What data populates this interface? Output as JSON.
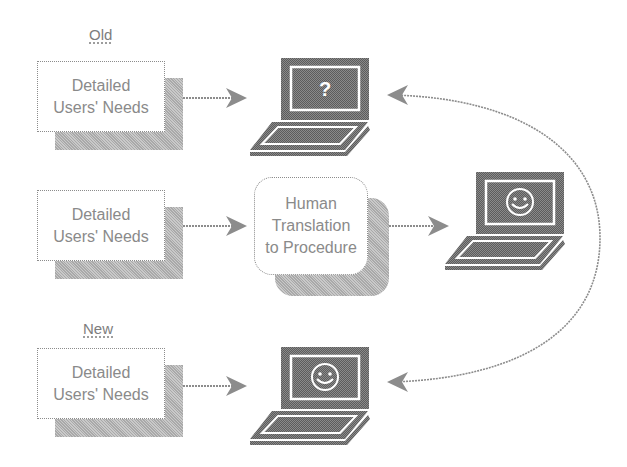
{
  "diagram": {
    "sections": {
      "old_label": "Old",
      "new_label": "New"
    },
    "rows": [
      {
        "source_box": {
          "line1": "Detailed",
          "line2": "Users' Needs"
        },
        "target": {
          "type": "laptop",
          "screen_icon": "question-mark-icon",
          "screen_glyph": "?"
        }
      },
      {
        "source_box": {
          "line1": "Detailed",
          "line2": "Users' Needs"
        },
        "intermediate": {
          "line1": "Human",
          "line2": "Translation",
          "line3": "to Procedure"
        },
        "target": {
          "type": "laptop",
          "screen_icon": "smiley-face-icon"
        }
      },
      {
        "source_box": {
          "line1": "Detailed",
          "line2": "Users' Needs"
        },
        "target": {
          "type": "laptop",
          "screen_icon": "smiley-face-icon"
        }
      }
    ],
    "connector": "curved double-headed arrow from middle laptop region to top and bottom laptops",
    "colors": {
      "ink": "#8a8a8a",
      "laptop_fill": "#6f6f6f",
      "shadow": "#b9b9b9",
      "background": "#ffffff"
    }
  }
}
